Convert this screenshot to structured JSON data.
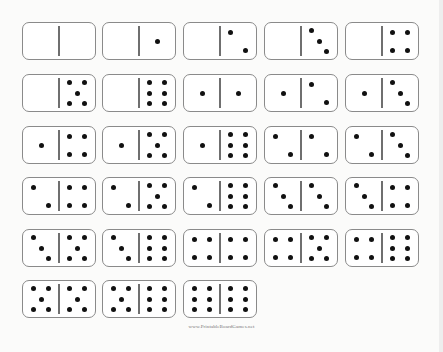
{
  "sheet": {
    "title": "Double-six domino set",
    "columns_x": [
      22,
      102,
      183,
      264,
      345
    ],
    "rows_y": [
      22,
      74,
      126,
      177,
      229,
      280
    ],
    "dominoes": [
      {
        "left": 0,
        "right": 0
      },
      {
        "left": 0,
        "right": 1
      },
      {
        "left": 0,
        "right": 2
      },
      {
        "left": 0,
        "right": 3
      },
      {
        "left": 0,
        "right": 4
      },
      {
        "left": 0,
        "right": 5
      },
      {
        "left": 0,
        "right": 6
      },
      {
        "left": 1,
        "right": 1
      },
      {
        "left": 1,
        "right": 2
      },
      {
        "left": 1,
        "right": 3
      },
      {
        "left": 1,
        "right": 4
      },
      {
        "left": 1,
        "right": 5
      },
      {
        "left": 1,
        "right": 6
      },
      {
        "left": 2,
        "right": 2
      },
      {
        "left": 2,
        "right": 3
      },
      {
        "left": 2,
        "right": 4
      },
      {
        "left": 2,
        "right": 5
      },
      {
        "left": 2,
        "right": 6
      },
      {
        "left": 3,
        "right": 3
      },
      {
        "left": 3,
        "right": 4
      },
      {
        "left": 3,
        "right": 5
      },
      {
        "left": 3,
        "right": 6
      },
      {
        "left": 4,
        "right": 4
      },
      {
        "left": 4,
        "right": 5
      },
      {
        "left": 4,
        "right": 6
      },
      {
        "left": 5,
        "right": 5
      },
      {
        "left": 5,
        "right": 6
      },
      {
        "left": 6,
        "right": 6
      }
    ]
  },
  "footer": {
    "text": "www.PrintableBoardGames.net"
  }
}
